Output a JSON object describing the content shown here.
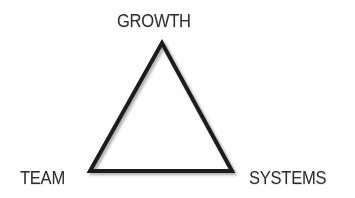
{
  "diagram": {
    "type": "triangle",
    "vertices": {
      "top": {
        "label": "GROWTH"
      },
      "bottom_left": {
        "label": "TEAM"
      },
      "bottom_right": {
        "label": "SYSTEMS"
      }
    },
    "colors": {
      "stroke": "#1e1e1e",
      "text": "#2e2e2e",
      "background": "#ffffff"
    }
  }
}
